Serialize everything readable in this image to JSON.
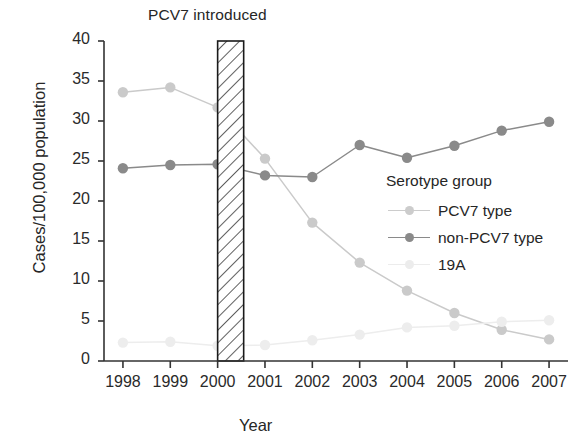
{
  "annotation": {
    "pcv7_introduced": "PCV7 introduced"
  },
  "axes": {
    "ylabel": "Cases/100,000 population",
    "xlabel": "Year",
    "yticks": [
      "0",
      "5",
      "10",
      "15",
      "20",
      "25",
      "30",
      "35",
      "40"
    ],
    "xticks": [
      "1998",
      "1999",
      "2000",
      "2001",
      "2002",
      "2003",
      "2004",
      "2005",
      "2006",
      "2007"
    ]
  },
  "legend": {
    "title": "Serotype group",
    "items": [
      {
        "label": "PCV7 type",
        "color": "#cccccc"
      },
      {
        "label": "non-PCV7 type",
        "color": "#8a8a8a"
      },
      {
        "label": "19A",
        "color": "#ececec"
      }
    ]
  },
  "colors": {
    "pcv7": "#cacaca",
    "non_pcv7": "#8a8a8a",
    "type19a": "#ededed",
    "axis": "#333333",
    "band_edge": "#1a1a1a"
  },
  "chart_data": {
    "type": "line",
    "title": "",
    "xlabel": "Year",
    "ylabel": "Cases/100,000 population",
    "x": [
      1998,
      1999,
      2000,
      2001,
      2002,
      2003,
      2004,
      2005,
      2006,
      2007
    ],
    "categories": [
      "1998",
      "1999",
      "2000",
      "2001",
      "2002",
      "2003",
      "2004",
      "2005",
      "2006",
      "2007"
    ],
    "ylim": [
      0,
      40
    ],
    "xlim": [
      1997.6,
      2007.4
    ],
    "ytick_step": 5,
    "grid": false,
    "legend_position": "inside-right",
    "annotations": [
      {
        "text": "PCV7 introduced",
        "type": "vertical-band",
        "x_start": 2000.0,
        "x_end": 2000.55,
        "hatch": "diagonal"
      }
    ],
    "series": [
      {
        "name": "PCV7 type",
        "color": "#cacaca",
        "values": [
          33.6,
          34.2,
          31.7,
          25.3,
          17.3,
          12.3,
          8.8,
          6.0,
          3.9,
          2.7
        ]
      },
      {
        "name": "non-PCV7 type",
        "color": "#8a8a8a",
        "values": [
          24.1,
          24.5,
          24.6,
          23.2,
          23.0,
          27.0,
          25.4,
          26.9,
          28.8,
          29.9
        ]
      },
      {
        "name": "19A",
        "color": "#ededed",
        "values": [
          2.3,
          2.4,
          1.9,
          2.0,
          2.6,
          3.3,
          4.2,
          4.4,
          4.9,
          5.1
        ]
      }
    ]
  }
}
